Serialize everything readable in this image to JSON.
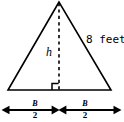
{
  "figure": {
    "name": "isosceles-triangle-with-height-and-base-halves",
    "type": "geometry-diagram",
    "background_color": "#ffffff",
    "stroke_color": "#000000",
    "labels": {
      "hypotenuse": "8 feet",
      "height": "h",
      "base_left_numerator": "B",
      "base_left_denominator": "2",
      "base_right_numerator": "B",
      "base_right_denominator": "2"
    },
    "elements": {
      "triangle": {
        "apex": [
          59,
          2
        ],
        "bottom_left": [
          8,
          90
        ],
        "bottom_right": [
          111,
          90
        ]
      },
      "altitude": {
        "from": [
          59,
          3
        ],
        "to": [
          59,
          90
        ],
        "style": "dashed"
      },
      "right_angle_marker": {
        "corner": [
          59,
          90
        ],
        "size": 7,
        "opens": "left"
      },
      "dimension_line": {
        "y": 110,
        "left_arrow_tip": [
          2,
          110
        ],
        "right_arrow_tip": [
          121,
          110
        ],
        "center_marker": [
          59,
          110
        ],
        "center_marker_type": "double-arrowhead-x"
      }
    }
  }
}
